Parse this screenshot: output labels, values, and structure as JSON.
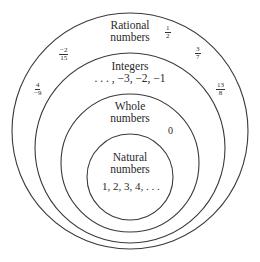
{
  "sets": [
    {
      "id": "rational",
      "label_line1": "Rational",
      "label_line2": "numbers",
      "cx": 130,
      "cy": 131,
      "r": 118
    },
    {
      "id": "integers",
      "label_line1": "Integers",
      "label_line2": ". . . , −3, −2, −1",
      "cx": 130,
      "cy": 148,
      "r": 95
    },
    {
      "id": "whole",
      "label_line1": "Whole",
      "label_line2": "numbers",
      "cx": 130,
      "cy": 163,
      "r": 69
    },
    {
      "id": "natural",
      "label_line1": "Natural",
      "label_line2": "numbers",
      "cx": 130,
      "cy": 177,
      "r": 43
    }
  ],
  "natural_values": "1, 2, 3, 4, . . .",
  "whole_extra": "0",
  "rational_examples": [
    {
      "num": "1",
      "den": "2"
    },
    {
      "num": "−2",
      "den": "15"
    },
    {
      "num": "3",
      "den": "7"
    },
    {
      "num": "4",
      "den": "−9"
    },
    {
      "num": "13",
      "den": "8"
    }
  ],
  "stroke_color": "#3a3a3a"
}
